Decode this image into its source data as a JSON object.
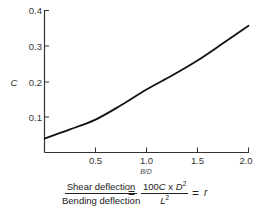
{
  "chart_data": {
    "type": "line",
    "title": "",
    "xlabel": "B/D",
    "ylabel": "C",
    "xlim": [
      0,
      2.0
    ],
    "ylim": [
      0,
      0.4
    ],
    "x_ticks": [
      "0.5",
      "1.0",
      "1.5",
      "2.0"
    ],
    "y_ticks": [
      "0.1",
      "0.2",
      "0.3",
      "0.4"
    ],
    "grid": false,
    "legend": null,
    "series": [
      {
        "name": "C",
        "x": [
          0,
          0.25,
          0.5,
          0.75,
          1.0,
          1.25,
          1.5,
          1.75,
          2.0
        ],
        "values": [
          0.04,
          0.066,
          0.094,
          0.135,
          0.18,
          0.22,
          0.263,
          0.312,
          0.362
        ]
      }
    ],
    "annotations": [
      "Shear deflection / Bending deflection = 100C x D^2 / L^2 = r"
    ]
  },
  "labels": {
    "y_axis": "C",
    "x_axis": "B/D",
    "y_ticks": [
      "0.1",
      "0.2",
      "0.3",
      "0.4"
    ],
    "x_ticks": [
      "0.5",
      "1.0",
      "1.5",
      "2.0"
    ]
  },
  "formula": {
    "left_numerator": "Shear deflection",
    "left_denominator": "Bending deflection",
    "equals": "=",
    "right_numerator_prefix": "100",
    "right_numerator_var": "C",
    "right_numerator_times": " x ",
    "right_numerator_d": "D",
    "right_numerator_exp": "2",
    "right_denominator_var": "L",
    "right_denominator_exp": "2",
    "equals2": "=",
    "result": "r"
  },
  "colors": {
    "line": "#111111",
    "axis": "#333333",
    "background": "#ffffff"
  }
}
